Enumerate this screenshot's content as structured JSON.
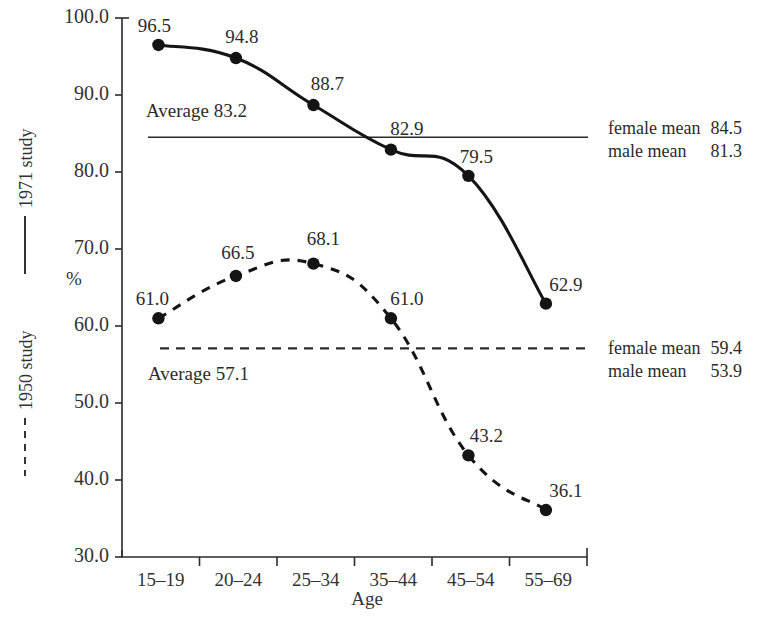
{
  "chart_data": {
    "type": "line",
    "title": "",
    "xlabel": "Age",
    "ylabel": "%",
    "categories": [
      "15–19",
      "20–24",
      "25–34",
      "35–44",
      "45–54",
      "55–69"
    ],
    "ylim": [
      30.0,
      100.0
    ],
    "y_ticks": [
      "30.0",
      "40.0",
      "50.0",
      "60.0",
      "70.0",
      "80.0",
      "90.0",
      "100.0"
    ],
    "y_tick_values": [
      30.0,
      40.0,
      50.0,
      60.0,
      70.0,
      80.0,
      90.0,
      100.0
    ],
    "grid": false,
    "legend_position": "left-rotated",
    "series": [
      {
        "name": "1971 study",
        "style": "solid",
        "values": [
          96.5,
          94.8,
          88.7,
          82.9,
          79.5,
          62.9
        ],
        "labels": [
          "96.5",
          "94.8",
          "88.7",
          "82.9",
          "79.5",
          "62.9"
        ]
      },
      {
        "name": "1950 study",
        "style": "dashed",
        "values": [
          61.0,
          66.5,
          68.1,
          61.0,
          43.2,
          36.1
        ],
        "labels": [
          "61.0",
          "66.5",
          "68.1",
          "61.0",
          "43.2",
          "36.1"
        ]
      }
    ],
    "reference_lines": [
      {
        "name": "1971-average",
        "style": "solid",
        "value": 84.5,
        "annotation": "Average 83.2"
      },
      {
        "name": "1950-average",
        "style": "dashed",
        "value": 57.1,
        "annotation": "Average 57.1"
      }
    ],
    "annotations": {
      "upper_average": "Average 83.2",
      "lower_average": "Average 57.1"
    }
  },
  "legend": {
    "upper": "1971 study",
    "lower": "1950 study"
  },
  "side_notes": {
    "upper": [
      {
        "label": "female mean",
        "value": "84.5"
      },
      {
        "label": "male mean",
        "value": "81.3"
      }
    ],
    "lower": [
      {
        "label": "female mean",
        "value": "59.4"
      },
      {
        "label": "male mean",
        "value": "53.9"
      }
    ]
  },
  "colors": {
    "ink": "#151515",
    "axis": "#2b2b2b",
    "background": "#ffffff"
  }
}
